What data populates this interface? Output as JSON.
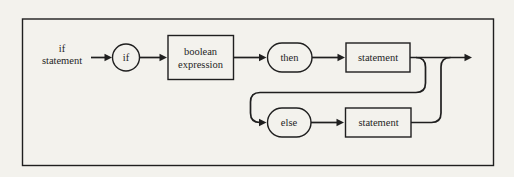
{
  "diagram": {
    "entry_label": {
      "line1": "if",
      "line2": "statement"
    },
    "nodes": {
      "if_keyword": "if",
      "boolean_expression_line1": "boolean",
      "boolean_expression_line2": "expression",
      "then_keyword": "then",
      "statement_top": "statement",
      "else_keyword": "else",
      "statement_bottom": "statement"
    },
    "colors": {
      "ink": "#1f1f1f",
      "paper": "#f3f2ed"
    }
  }
}
